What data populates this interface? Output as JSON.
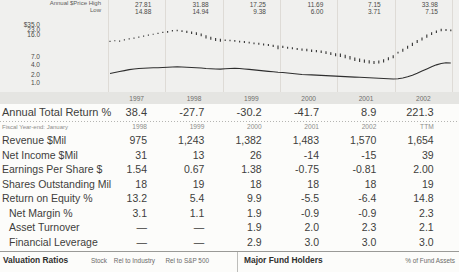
{
  "chart": {
    "price_label_high": "Annual $Price High",
    "price_label_low": "Low",
    "price_high": [
      "27.81",
      "31.88",
      "17.25",
      "11.69",
      "7.15",
      "33.98"
    ],
    "price_low": [
      "14.88",
      "14.94",
      "9.38",
      "6.00",
      "3.71",
      "7.15"
    ],
    "years": [
      "1997",
      "1998",
      "1999",
      "2000",
      "2001",
      "2002"
    ]
  },
  "chart_data": {
    "type": "ohlc",
    "title": "",
    "xlabel": "",
    "ylabel": "",
    "yscale": "log",
    "grid": true,
    "legend": "none",
    "yticks": [
      "$35.0",
      "23.0",
      "16.0",
      "7.0",
      "4.0",
      "2.0",
      "1.0"
    ],
    "ytick_values": [
      35.0,
      23.0,
      16.0,
      7.0,
      4.0,
      2.0,
      1.0
    ],
    "ytick_y": [
      24.7,
      29.7,
      34.7,
      56.3,
      64.7,
      74.7,
      82.7
    ],
    "categories": [
      "1997",
      "1998",
      "1999",
      "2000",
      "2001",
      "2002"
    ],
    "annual_high": [
      27.81,
      31.88,
      17.25,
      11.69,
      7.15,
      33.98
    ],
    "annual_low": [
      14.88,
      14.94,
      9.38,
      6.0,
      3.71,
      7.15
    ],
    "monthly_high": [
      15.8,
      16.5,
      16.2,
      17.4,
      18.6,
      19.5,
      20.8,
      22.0,
      23.4,
      24.8,
      26.2,
      27.81,
      29.5,
      31.2,
      31.88,
      31.0,
      29.8,
      28.5,
      27.0,
      25.0,
      22.5,
      20.5,
      19.0,
      18.0,
      17.25,
      17.0,
      16.6,
      16.0,
      15.6,
      15.0,
      14.4,
      14.0,
      13.5,
      13.0,
      12.4,
      11.8,
      11.69,
      11.0,
      10.6,
      10.2,
      9.8,
      9.6,
      9.2,
      9.0,
      8.6,
      8.2,
      7.8,
      7.3,
      7.15,
      6.6,
      6.1,
      5.6,
      5.2,
      4.9,
      4.7,
      4.5,
      4.6,
      5.0,
      5.7,
      6.4,
      8.0,
      9.6,
      11.6,
      14.0,
      16.6,
      19.6,
      23.6,
      27.2,
      30.2,
      33.98,
      33.2,
      32.4
    ],
    "monthly_low": [
      14.88,
      15.4,
      15.1,
      16.3,
      17.4,
      18.3,
      19.5,
      20.6,
      21.9,
      23.2,
      24.5,
      26.0,
      26.5,
      28.5,
      28.8,
      27.5,
      26.0,
      24.5,
      23.0,
      21.0,
      18.5,
      17.0,
      15.8,
      14.94,
      15.6,
      15.4,
      14.9,
      14.4,
      13.9,
      13.4,
      12.9,
      12.5,
      11.9,
      11.4,
      10.7,
      9.38,
      10.1,
      9.7,
      9.3,
      8.9,
      8.5,
      8.3,
      7.9,
      7.7,
      7.4,
      7.0,
      6.5,
      6.0,
      5.8,
      5.3,
      4.9,
      4.5,
      4.2,
      4.0,
      3.85,
      3.71,
      3.85,
      4.1,
      4.7,
      5.3,
      7.15,
      8.0,
      9.6,
      11.5,
      13.8,
      16.3,
      19.3,
      22.8,
      26.0,
      29.0,
      29.6,
      28.8
    ],
    "relative_strength": [
      122,
      126,
      130,
      134,
      138,
      141,
      143,
      144,
      145,
      146,
      146,
      147,
      148,
      149,
      150,
      149,
      148,
      147,
      146,
      145,
      143,
      142,
      141,
      140,
      142,
      143,
      144,
      143,
      141,
      139,
      137,
      135,
      133,
      131,
      129,
      127,
      126,
      124,
      122,
      120,
      118,
      117,
      116,
      115,
      114,
      113,
      112,
      111,
      110,
      109,
      108,
      107,
      106,
      105,
      104,
      103,
      102,
      101,
      100,
      99,
      100,
      103,
      108,
      115,
      123,
      132,
      141,
      150,
      158,
      164,
      167,
      166
    ],
    "rs_min": 99,
    "rs_max": 167
  },
  "table": {
    "rows": [
      {
        "label": "Annual Total Return %",
        "style": "major",
        "indent": false,
        "values": [
          "38.4",
          "-27.7",
          "-30.2",
          "-41.7",
          "8.9",
          "221.3"
        ]
      },
      {
        "label": "Fiscal Year-end: January",
        "style": "small",
        "indent": false,
        "values": [
          "1998",
          "1999",
          "2000",
          "2001",
          "2002",
          "TTM"
        ]
      },
      {
        "label": "Revenue $Mil",
        "style": "normal",
        "indent": false,
        "values": [
          "975",
          "1,243",
          "1,382",
          "1,483",
          "1,570",
          "1,654"
        ]
      },
      {
        "label": "Net Income $Mil",
        "style": "normal",
        "indent": false,
        "values": [
          "31",
          "13",
          "26",
          "-14",
          "-15",
          "39"
        ]
      },
      {
        "label": "Earnings Per Share $",
        "style": "normal",
        "indent": false,
        "values": [
          "1.54",
          "0.67",
          "1.38",
          "-0.75",
          "-0.81",
          "2.00"
        ]
      },
      {
        "label": "Shares Outstanding Mil",
        "style": "normal",
        "indent": false,
        "values": [
          "18",
          "19",
          "18",
          "18",
          "18",
          "19"
        ]
      },
      {
        "label": "Return on Equity %",
        "style": "normal",
        "indent": false,
        "values": [
          "13.2",
          "5.4",
          "9.9",
          "-5.5",
          "-6.4",
          "14.8"
        ]
      },
      {
        "label": "Net Margin %",
        "style": "normal",
        "indent": true,
        "values": [
          "3.1",
          "1.1",
          "1.9",
          "-0.9",
          "-0.9",
          "2.3"
        ]
      },
      {
        "label": "Asset Turnover",
        "style": "normal",
        "indent": true,
        "values": [
          "—",
          "—",
          "1.9",
          "2.0",
          "2.3",
          "2.1"
        ]
      },
      {
        "label": "Financial Leverage",
        "style": "normal",
        "indent": true,
        "values": [
          "—",
          "—",
          "2.9",
          "3.0",
          "3.0",
          "3.0"
        ]
      }
    ]
  },
  "bottom": {
    "left": {
      "title": "Valuation Ratios",
      "cols": [
        "Stock",
        "Rel to Industry",
        "Rel to S&P 500"
      ]
    },
    "right": {
      "title": "Major Fund Holders",
      "col": "% of Fund Assets"
    }
  },
  "colors": {
    "text": "#3e3e3c",
    "muted": "#8d8d8b",
    "chart_bg": "#f0f0ee",
    "band_bg": "#e5e5e2",
    "bar": "#3a3a3a",
    "line": "#2e2e2e",
    "grid": "#dedbd6"
  }
}
